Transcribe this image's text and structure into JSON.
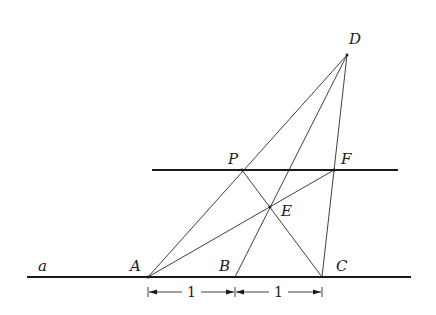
{
  "diagram": {
    "type": "geometric-construction",
    "lines": {
      "base_line": {
        "label": "a",
        "x1": 27,
        "y1": 277,
        "x2": 411,
        "y2": 277
      },
      "upper_parallel": {
        "x1": 152,
        "y1": 170,
        "x2": 398,
        "y2": 170
      }
    },
    "points": {
      "A": {
        "label": "A",
        "x": 148,
        "y": 277
      },
      "B": {
        "label": "B",
        "x": 235,
        "y": 277
      },
      "C": {
        "label": "C",
        "x": 322,
        "y": 277
      },
      "D": {
        "label": "D",
        "x": 347,
        "y": 55
      },
      "P": {
        "label": "P",
        "x": 242,
        "y": 170
      },
      "F": {
        "label": "F",
        "x": 334,
        "y": 170
      },
      "E": {
        "label": "E",
        "x": 270,
        "y": 207
      }
    },
    "segments": [
      {
        "from": "A",
        "to": "D"
      },
      {
        "from": "B",
        "to": "D"
      },
      {
        "from": "C",
        "to": "D"
      },
      {
        "from": "A",
        "to": "F"
      },
      {
        "from": "P",
        "to": "C"
      }
    ],
    "dimensions": [
      {
        "from": "A",
        "to": "B",
        "label": "1"
      },
      {
        "from": "B",
        "to": "C",
        "label": "1"
      }
    ],
    "line_label": "a"
  }
}
